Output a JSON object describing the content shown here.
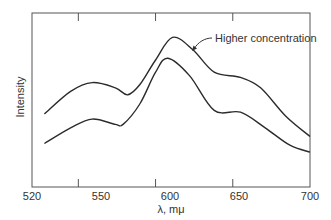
{
  "chart_data": {
    "type": "line",
    "title": "",
    "xlabel": "λ, mμ",
    "ylabel": "Intensity",
    "xlim": [
      520,
      700
    ],
    "ylim": [
      0,
      100
    ],
    "xticks": [
      520,
      550,
      600,
      650,
      700
    ],
    "yticks": [],
    "grid": false,
    "legend": null,
    "annotations": [
      {
        "text": "Higher concentration",
        "points_to_series": "Higher concentration",
        "x": 624,
        "y": 79
      }
    ],
    "series": [
      {
        "name": "Higher concentration",
        "x": [
          528,
          545,
          559,
          574,
          582,
          590,
          600,
          611,
          624,
          638,
          655,
          668,
          684,
          700
        ],
        "values": [
          42,
          55,
          60,
          57,
          53,
          59,
          73,
          86,
          79,
          66,
          63,
          57,
          41,
          29
        ]
      },
      {
        "name": "Lower concentration",
        "x": [
          528,
          545,
          559,
          574,
          579,
          590,
          600,
          608,
          622,
          638,
          655,
          671,
          687,
          700
        ],
        "values": [
          25,
          34,
          39,
          36,
          36,
          48,
          66,
          74,
          64,
          44,
          43,
          34,
          24,
          20
        ]
      }
    ]
  },
  "labels": {
    "xlabel": "λ, mμ",
    "ylabel": "Intensity",
    "annotation": "Higher concentration",
    "xticks": [
      "520",
      "550",
      "600",
      "650",
      "700"
    ]
  },
  "colors": {
    "line": "#2b2b2b",
    "frame": "#555555"
  }
}
